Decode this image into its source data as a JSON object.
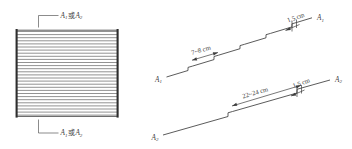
{
  "figure": {
    "panels": {
      "left": {
        "name": "hatched-rectangle-panel",
        "top_label": "A₁或A₂",
        "top_label_main": "A",
        "top_label_sub1": "1",
        "top_label_cjk": "或",
        "top_label_main2": "A",
        "top_label_sub2": "2",
        "bottom_label": "A₁或A₂",
        "hatch_line_count": 30,
        "hatch_color": "#6e6e6e",
        "edge_color": "#2e2e2e"
      },
      "right": {
        "name": "stepped-lines-panel",
        "upper_line_label": "A₁",
        "upper_line_label_main": "A",
        "upper_line_label_sub": "1",
        "upper_line_end_label": "A₁",
        "lower_line_label": "A₂",
        "lower_line_label_main": "A",
        "lower_line_label_sub": "2",
        "lower_line_end_label": "A₂",
        "dimensions": [
          {
            "id": "upper-spacing",
            "text": "7~8 cm",
            "value_min": 7,
            "value_max": 8,
            "unit": "cm"
          },
          {
            "id": "upper-notch",
            "text": "1.5 cm",
            "value": 1.5,
            "unit": "cm"
          },
          {
            "id": "lower-spacing",
            "text": "22~24 cm",
            "value_min": 22,
            "value_max": 24,
            "unit": "cm"
          },
          {
            "id": "lower-notch",
            "text": "1.5 cm",
            "value": 1.5,
            "unit": "cm"
          }
        ]
      }
    },
    "colors": {
      "background": "#ffffff",
      "ink": "#3d3d3d",
      "hatch": "#6e6e6e",
      "edge": "#2e2e2e"
    }
  }
}
